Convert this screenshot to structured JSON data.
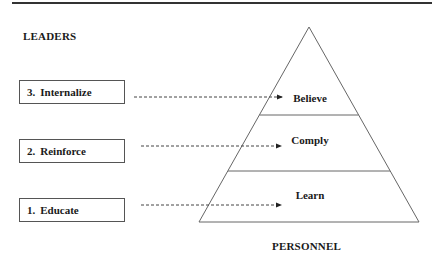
{
  "diagram": {
    "title_left": "LEADERS",
    "title_bottom": "PERSONNEL",
    "leader_steps": [
      {
        "number": "3.",
        "label": "Internalize",
        "target": "Believe"
      },
      {
        "number": "2.",
        "label": "Reinforce",
        "target": "Comply"
      },
      {
        "number": "1.",
        "label": "Educate",
        "target": "Learn"
      }
    ],
    "pyramid_levels": [
      {
        "label": "Believe",
        "position": "top"
      },
      {
        "label": "Comply",
        "position": "middle"
      },
      {
        "label": "Learn",
        "position": "bottom"
      }
    ],
    "colors": {
      "line": "#555555",
      "text": "#1a1a1a",
      "background": "#ffffff"
    }
  }
}
